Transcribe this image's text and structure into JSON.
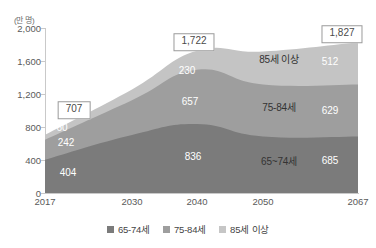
{
  "chart_data": {
    "type": "area",
    "title": "",
    "subtitle": "",
    "unit_label": "(만 명)",
    "xlabel": "",
    "ylabel": "",
    "x": [
      2017,
      2030,
      2040,
      2050,
      2067
    ],
    "categories": [
      "2017",
      "2030",
      "2040",
      "2050",
      "2067"
    ],
    "ylim": [
      0,
      2000
    ],
    "yticks": [
      0,
      400,
      800,
      1200,
      1600,
      2000
    ],
    "ytick_labels": [
      "0",
      "400",
      "800",
      "1,200",
      "1,600",
      "2,000"
    ],
    "grid": false,
    "stacked": true,
    "legend_position": "bottom",
    "series": [
      {
        "name": "65-74세",
        "color": "#7b7b7b",
        "values": [
          404,
          704,
          836,
          685,
          685
        ],
        "labels": [
          {
            "x": "2017",
            "value": "404"
          },
          {
            "x": "2040",
            "value": "836"
          },
          {
            "x": "2067",
            "value": "685"
          }
        ]
      },
      {
        "name": "75-84세",
        "color": "#9e9e9e",
        "values": [
          242,
          420,
          657,
          629,
          629
        ],
        "labels": [
          {
            "x": "2017",
            "value": "242"
          },
          {
            "x": "2040",
            "value": "657"
          },
          {
            "x": "2067",
            "value": "629"
          }
        ]
      },
      {
        "name": "85세 이상",
        "color": "#c4c4c4",
        "values": [
          60,
          132,
          230,
          400,
          512
        ],
        "labels": [
          {
            "x": "2017",
            "value": "60"
          },
          {
            "x": "2040",
            "value": "230"
          },
          {
            "x": "2067",
            "value": "512"
          }
        ]
      }
    ],
    "totals": [
      {
        "x": "2017",
        "value": "707"
      },
      {
        "x": "2040",
        "value": "1,722"
      },
      {
        "x": "2067",
        "value": "1,827"
      }
    ],
    "annotations": [
      {
        "text": "85세 이상",
        "series": "85세 이상"
      },
      {
        "text": "75-84세",
        "series": "75-84세"
      },
      {
        "text": "65~74세",
        "series": "65-74세"
      }
    ]
  },
  "legend": {
    "items": [
      {
        "label": "65-74세",
        "color": "#7b7b7b"
      },
      {
        "label": "75-84세",
        "color": "#9e9e9e"
      },
      {
        "label": "85세 이상",
        "color": "#c4c4c4"
      }
    ]
  },
  "axis": {
    "y_labels": [
      "2,000",
      "1,600",
      "1,200",
      "800",
      "400",
      "0"
    ],
    "x_labels": [
      "2017",
      "2030",
      "2040",
      "2050",
      "2067"
    ]
  },
  "value_labels": {
    "y2017_65": "404",
    "y2017_75": "242",
    "y2017_85": "60",
    "y2040_65": "836",
    "y2040_75": "657",
    "y2040_85": "230",
    "y2067_65": "685",
    "y2067_75": "629",
    "y2067_85": "512"
  },
  "band_names": {
    "top": "85세 이상",
    "middle": "75-84세",
    "bottom": "65~74세"
  },
  "totals": {
    "t2017": "707",
    "t2040": "1,722",
    "t2067": "1,827"
  },
  "unit": "(만 명)"
}
